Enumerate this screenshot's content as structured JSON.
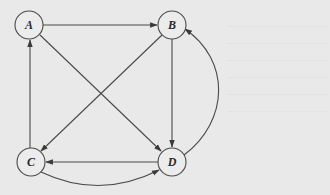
{
  "diagram": {
    "type": "directed-graph",
    "colors": {
      "background": "#e9e9e9",
      "stroke": "#4a4a4a",
      "node_fill": "#ececec",
      "label": "#2a2a2a"
    },
    "nodes": [
      {
        "id": "A",
        "label": "A",
        "cx": 29,
        "cy": 25
      },
      {
        "id": "B",
        "label": "B",
        "cx": 172,
        "cy": 25
      },
      {
        "id": "C",
        "label": "C",
        "cx": 31,
        "cy": 162
      },
      {
        "id": "D",
        "label": "D",
        "cx": 172,
        "cy": 162
      }
    ],
    "node_radius": 14,
    "edges": [
      {
        "from": "A",
        "to": "B",
        "shape": "straight"
      },
      {
        "from": "C",
        "to": "A",
        "shape": "straight"
      },
      {
        "from": "A",
        "to": "D",
        "shape": "straight"
      },
      {
        "from": "B",
        "to": "C",
        "shape": "straight"
      },
      {
        "from": "B",
        "to": "D",
        "shape": "straight"
      },
      {
        "from": "D",
        "to": "C",
        "shape": "straight"
      },
      {
        "from": "C",
        "to": "D",
        "shape": "curved-below"
      },
      {
        "from": "D",
        "to": "B",
        "shape": "curved-right"
      }
    ]
  }
}
